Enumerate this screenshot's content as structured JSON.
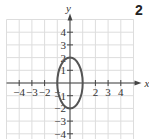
{
  "problem_number": "2",
  "chart_data": {
    "type": "line",
    "title": "",
    "xlabel": "x",
    "ylabel": "y",
    "xlim": [
      -5,
      5
    ],
    "ylim": [
      -4.5,
      5
    ],
    "grid": true,
    "x_ticks": [
      "-4",
      "-3",
      "-2",
      "-1",
      "2",
      "3",
      "4"
    ],
    "y_ticks": [
      "4",
      "3",
      "2",
      "1",
      "-1",
      "-2",
      "-3",
      "-4"
    ],
    "curve": {
      "shape": "ellipse",
      "center": [
        0,
        0
      ],
      "semi_axis_x": 1,
      "semi_axis_y": 2,
      "equation": "x^2 + y^2/4 = 1"
    }
  },
  "axis": {
    "x": "x",
    "y": "y"
  },
  "ticks": {
    "x": [
      {
        "v": -4,
        "t": "−4"
      },
      {
        "v": -3,
        "t": "−3"
      },
      {
        "v": -2,
        "t": "−2"
      },
      {
        "v": -1,
        "t": "−"
      },
      {
        "v": 2,
        "t": "2"
      },
      {
        "v": 3,
        "t": "3"
      },
      {
        "v": 4,
        "t": "4"
      }
    ],
    "y": [
      {
        "v": 4,
        "t": "4"
      },
      {
        "v": 3,
        "t": "3"
      },
      {
        "v": 2,
        "t": "2"
      },
      {
        "v": 1,
        "t": "1"
      },
      {
        "v": -1,
        "t": "−1"
      },
      {
        "v": -2,
        "t": "−2"
      },
      {
        "v": -3,
        "t": "−3"
      },
      {
        "v": -4,
        "t": "−4"
      }
    ]
  }
}
